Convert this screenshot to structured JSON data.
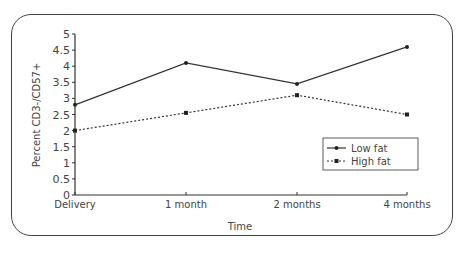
{
  "chart_data": {
    "type": "line",
    "title": "",
    "xlabel": "Time",
    "ylabel": "Percent CD3-/CD57+",
    "categories": [
      "Delivery",
      "1 month",
      "2 months",
      "4 months"
    ],
    "ylim": [
      0,
      5
    ],
    "yticks": [
      "0",
      "0.5",
      "1",
      "1.5",
      "2",
      "2.5",
      "3",
      "3.5",
      "4",
      "4.5",
      "5"
    ],
    "grid": false,
    "legend_position": "right",
    "series": [
      {
        "name": "Low fat",
        "style": "solid",
        "values": [
          2.8,
          4.1,
          3.45,
          4.6
        ]
      },
      {
        "name": "High fat",
        "style": "dotted",
        "values": [
          2.0,
          2.55,
          3.1,
          2.5
        ]
      }
    ]
  },
  "legend": {
    "low": "Low fat",
    "high": "High fat"
  }
}
